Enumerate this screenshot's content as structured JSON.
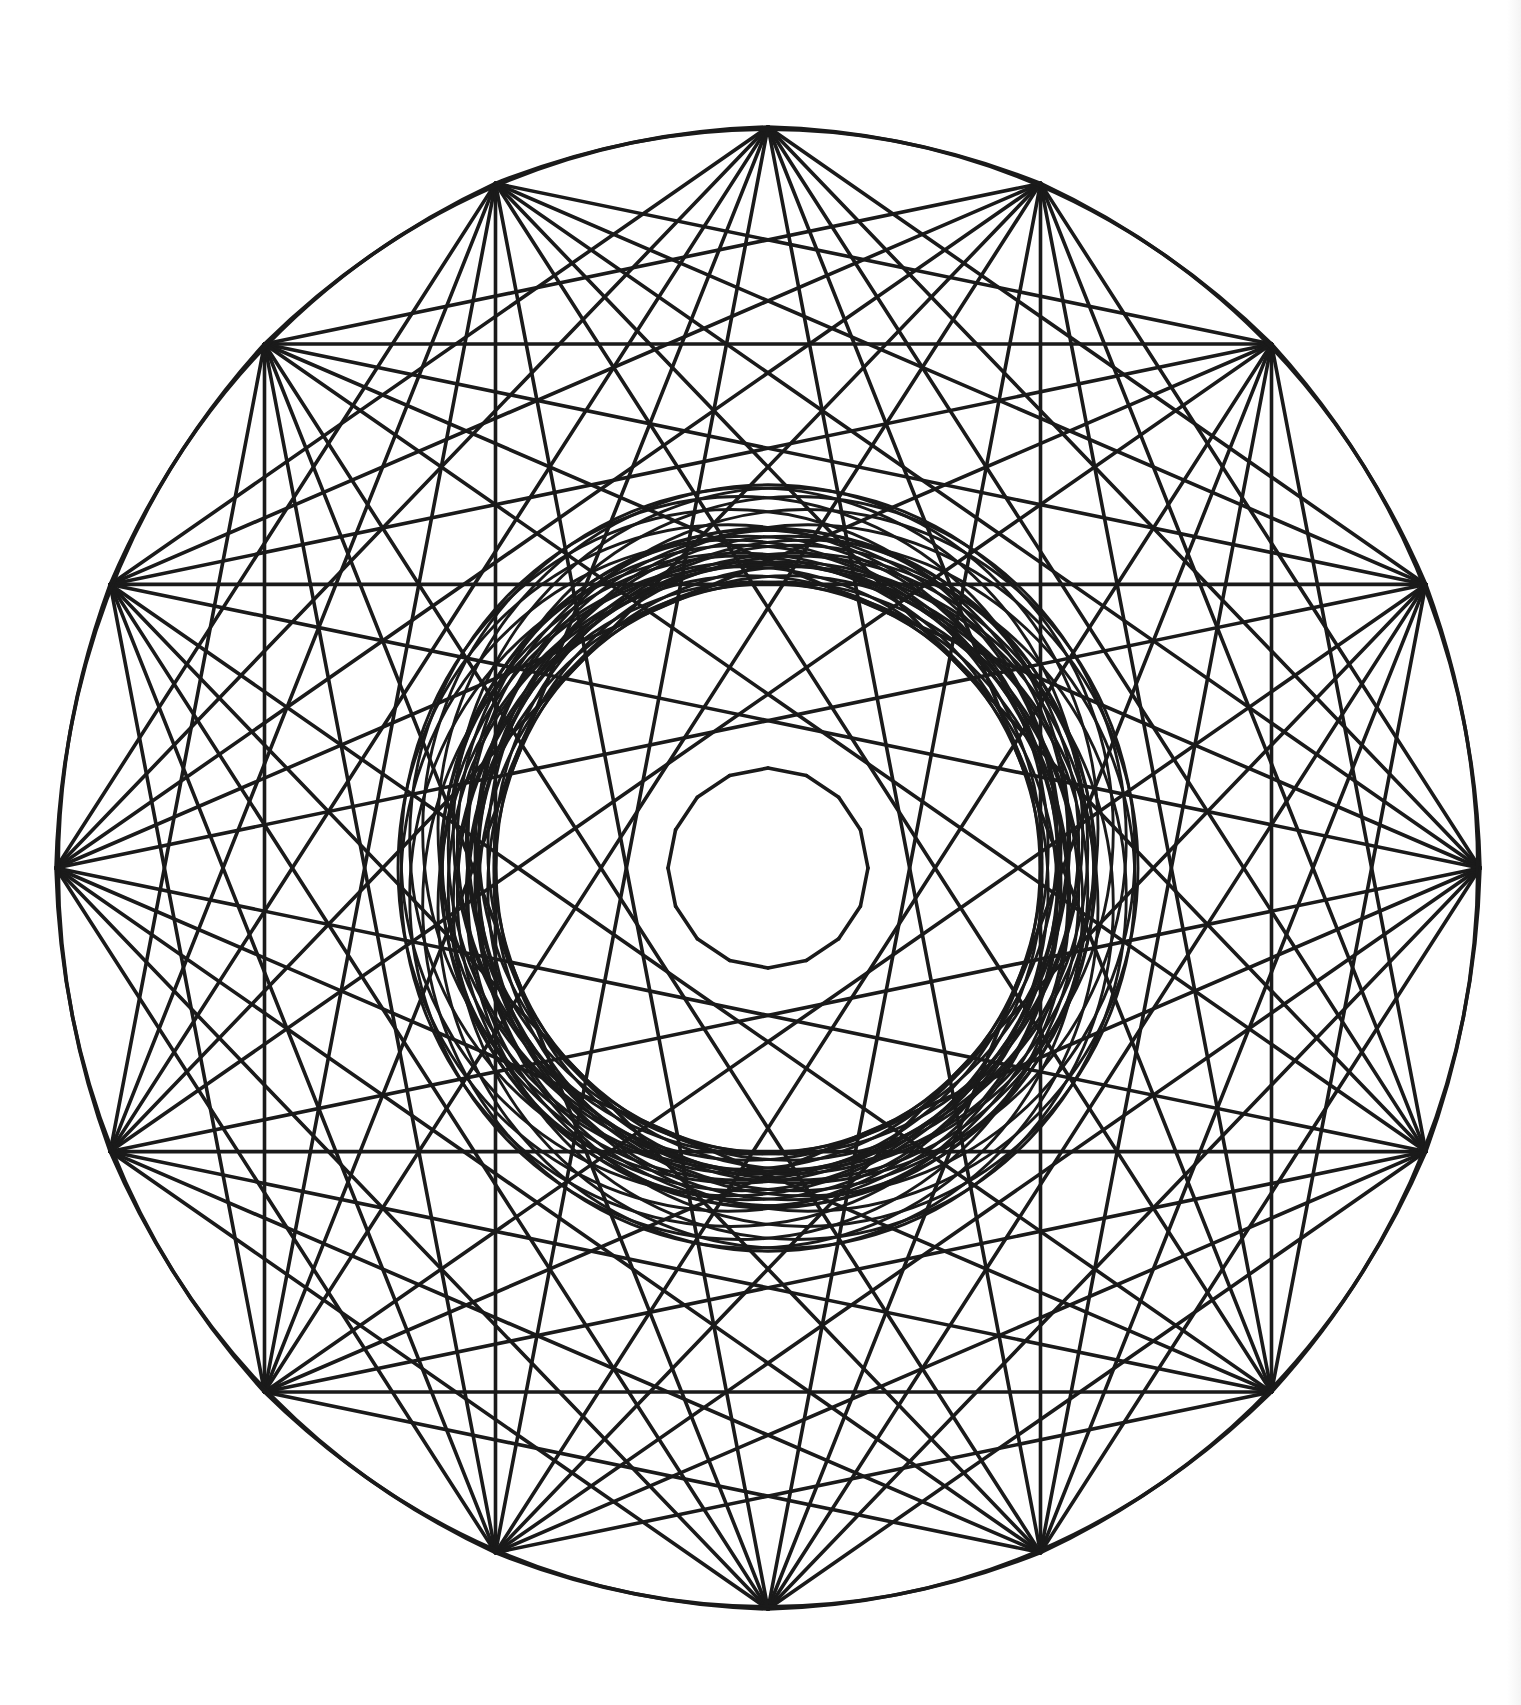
{
  "figure": {
    "background_color": "#ffffff",
    "stroke_color": "#1a1a1a",
    "stroke_width": 3.6,
    "center": [
      768,
      868
    ],
    "radius_x": 712,
    "radius_y": 741,
    "points": 16,
    "fan_steps": [
      3,
      4,
      5,
      6,
      7
    ],
    "tip_roundness": 0.06,
    "inner_hole_radius": 100,
    "inner_rings": [
      {
        "radius": 300,
        "offset": 28
      },
      {
        "radius": 330,
        "offset": 40
      }
    ]
  }
}
